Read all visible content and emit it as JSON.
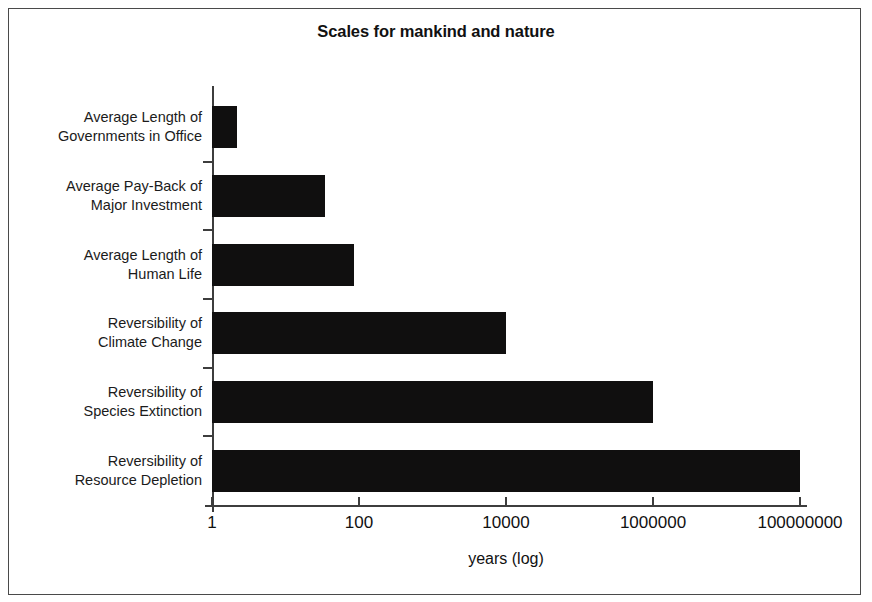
{
  "chart_data": {
    "type": "bar",
    "orientation": "horizontal",
    "title": "Scales for mankind and nature",
    "xlabel": "years (log)",
    "ylabel": "",
    "xscale": "log",
    "xlim": [
      1,
      100000000
    ],
    "grid": false,
    "legend": null,
    "xticks": [
      {
        "value": 1,
        "label": "1"
      },
      {
        "value": 100,
        "label": "100"
      },
      {
        "value": 10000,
        "label": "10000"
      },
      {
        "value": 1000000,
        "label": "1000000"
      },
      {
        "value": 100000000,
        "label": "100000000"
      }
    ],
    "categories": [
      "Average Length of Governments in Office",
      "Average Pay-Back of Major Investment",
      "Average Length of Human Life",
      "Reversibility of Climate Change",
      "Reversibility of Species Extinction",
      "Reversibility of Resource Depletion"
    ],
    "values": [
      2.2,
      35,
      85,
      10000,
      1000000,
      100000000
    ],
    "bar_color": "#100f0f"
  },
  "bars": [
    {
      "line1": "Average Length of",
      "line2": "Governments in Office",
      "value": 2.2
    },
    {
      "line1": "Average Pay-Back of",
      "line2": "Major Investment",
      "value": 35
    },
    {
      "line1": "Average Length of",
      "line2": "Human Life",
      "value": 85
    },
    {
      "line1": "Reversibility of",
      "line2": "Climate Change",
      "value": 10000
    },
    {
      "line1": "Reversibility of",
      "line2": "Species Extinction",
      "value": 1000000
    },
    {
      "line1": "Reversibility of",
      "line2": "Resource Depletion",
      "value": 100000000
    }
  ]
}
